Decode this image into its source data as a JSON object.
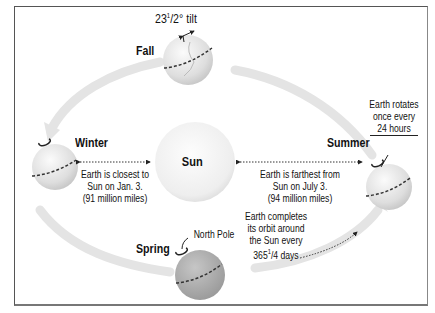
{
  "diagram": {
    "center": {
      "label": "Sun"
    },
    "seasons": [
      {
        "name": "Fall",
        "position": "top"
      },
      {
        "name": "Winter",
        "position": "left"
      },
      {
        "name": "Summer",
        "position": "right"
      },
      {
        "name": "Spring",
        "position": "bottom"
      }
    ],
    "annotations": {
      "tilt": {
        "main": "23",
        "sup": "1",
        "frac": "/2° tilt"
      },
      "rotation": [
        "Earth rotates",
        "once every",
        "24 hours"
      ],
      "closest": [
        "Earth is closest to",
        "Sun on Jan. 3.",
        "(91 million miles)"
      ],
      "farthest": [
        "Earth is farthest from",
        "Sun on July 3.",
        "(94 million miles)"
      ],
      "orbit": {
        "lines": [
          "Earth completes",
          "its orbit around",
          "the Sun every"
        ],
        "days_main": "365",
        "days_sup": "1",
        "days_frac": "/4 days"
      },
      "north_pole": "North Pole"
    },
    "colors": {
      "globe_fill": "#dcdcdc",
      "globe_spring": "#a8a8a8",
      "sun_fill": "#f2f2f2",
      "orbit_arrow": "#e2e2e2",
      "text": "#111111",
      "frame": "#555555"
    }
  }
}
